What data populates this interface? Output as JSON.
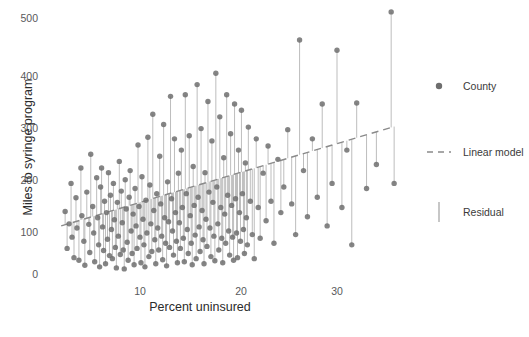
{
  "chart_data": {
    "type": "scatter",
    "title": "",
    "xlabel": "Percent uninsured",
    "ylabel": "Miles to syringe program",
    "xlim": [
      1.5,
      37.5
    ],
    "ylim": [
      -18,
      520
    ],
    "xticks": [
      10,
      20,
      30
    ],
    "yticks": [
      0,
      100,
      200,
      300,
      400,
      500
    ],
    "grid": false,
    "legend_position": "right",
    "point_color": "#6e6e6e",
    "line_color": "#8a8a8a",
    "residual_color": "#b5b5b5",
    "legend": [
      {
        "label": "County",
        "marker": "circle"
      },
      {
        "label": "Linear model",
        "marker": "dashed-line"
      },
      {
        "label": "Residual",
        "marker": "vertical-line"
      }
    ],
    "linear_model": {
      "x_start": 2.0,
      "y_start": 92.0,
      "x_end": 35.8,
      "y_end": 286.0,
      "slope": 5.74,
      "intercept": 80.5
    },
    "series": [
      {
        "name": "County",
        "points": [
          [
            2.4,
            120
          ],
          [
            2.6,
            48
          ],
          [
            2.8,
            96
          ],
          [
            3.0,
            175
          ],
          [
            3.1,
            70
          ],
          [
            3.3,
            30
          ],
          [
            3.5,
            147
          ],
          [
            3.6,
            88
          ],
          [
            3.8,
            25
          ],
          [
            4.0,
            205
          ],
          [
            4.1,
            112
          ],
          [
            4.3,
            62
          ],
          [
            4.4,
            15
          ],
          [
            4.6,
            158
          ],
          [
            4.8,
            95
          ],
          [
            4.9,
            40
          ],
          [
            5.0,
            232
          ],
          [
            5.2,
            130
          ],
          [
            5.3,
            78
          ],
          [
            5.4,
            22
          ],
          [
            5.6,
            186
          ],
          [
            5.7,
            108
          ],
          [
            5.8,
            55
          ],
          [
            5.9,
            12
          ],
          [
            6.0,
            168
          ],
          [
            6.1,
            205
          ],
          [
            6.2,
            90
          ],
          [
            6.3,
            44
          ],
          [
            6.4,
            140
          ],
          [
            6.5,
            18
          ],
          [
            6.6,
            118
          ],
          [
            6.7,
            66
          ],
          [
            6.8,
            196
          ],
          [
            6.9,
            34
          ],
          [
            7.0,
            152
          ],
          [
            7.1,
            85
          ],
          [
            7.2,
            28
          ],
          [
            7.3,
            175
          ],
          [
            7.4,
            104
          ],
          [
            7.5,
            50
          ],
          [
            7.6,
            10
          ],
          [
            7.7,
            138
          ],
          [
            7.8,
            72
          ],
          [
            7.9,
            218
          ],
          [
            8.0,
            36
          ],
          [
            8.1,
            160
          ],
          [
            8.2,
            98
          ],
          [
            8.3,
            45
          ],
          [
            8.4,
            8
          ],
          [
            8.5,
            182
          ],
          [
            8.6,
            125
          ],
          [
            8.7,
            60
          ],
          [
            8.8,
            25
          ],
          [
            8.9,
            148
          ],
          [
            9.0,
            200
          ],
          [
            9.1,
            82
          ],
          [
            9.2,
            38
          ],
          [
            9.3,
            115
          ],
          [
            9.4,
            16
          ],
          [
            9.5,
            165
          ],
          [
            9.6,
            92
          ],
          [
            9.7,
            48
          ],
          [
            9.8,
            250
          ],
          [
            9.9,
            130
          ],
          [
            10.0,
            70
          ],
          [
            10.1,
            20
          ],
          [
            10.2,
            188
          ],
          [
            10.3,
            105
          ],
          [
            10.4,
            55
          ],
          [
            10.5,
            12
          ],
          [
            10.6,
            142
          ],
          [
            10.7,
            78
          ],
          [
            10.8,
            265
          ],
          [
            10.9,
            32
          ],
          [
            11.0,
            172
          ],
          [
            11.1,
            96
          ],
          [
            11.2,
            42
          ],
          [
            11.3,
            310
          ],
          [
            11.4,
            122
          ],
          [
            11.5,
            65
          ],
          [
            11.6,
            18
          ],
          [
            11.7,
            155
          ],
          [
            11.8,
            88
          ],
          [
            11.9,
            45
          ],
          [
            12.0,
            228
          ],
          [
            12.1,
            135
          ],
          [
            12.2,
            72
          ],
          [
            12.3,
            26
          ],
          [
            12.4,
            290
          ],
          [
            12.5,
            108
          ],
          [
            12.6,
            58
          ],
          [
            12.7,
            14
          ],
          [
            12.8,
            178
          ],
          [
            12.9,
            100
          ],
          [
            13.0,
            50
          ],
          [
            13.1,
            345
          ],
          [
            13.2,
            145
          ],
          [
            13.3,
            82
          ],
          [
            13.4,
            35
          ],
          [
            13.5,
            262
          ],
          [
            13.6,
            118
          ],
          [
            13.7,
            62
          ],
          [
            13.8,
            20
          ],
          [
            13.9,
            195
          ],
          [
            14.0,
            98
          ],
          [
            14.1,
            48
          ],
          [
            14.2,
            240
          ],
          [
            14.3,
            128
          ],
          [
            14.4,
            68
          ],
          [
            14.5,
            22
          ],
          [
            14.6,
            348
          ],
          [
            14.7,
            155
          ],
          [
            14.8,
            85
          ],
          [
            14.9,
            38
          ],
          [
            15.0,
            268
          ],
          [
            15.1,
            112
          ],
          [
            15.2,
            58
          ],
          [
            15.3,
            16
          ],
          [
            15.4,
            208
          ],
          [
            15.5,
            132
          ],
          [
            15.6,
            74
          ],
          [
            15.7,
            28
          ],
          [
            15.8,
            368
          ],
          [
            15.9,
            148
          ],
          [
            16.0,
            90
          ],
          [
            16.1,
            42
          ],
          [
            16.2,
            282
          ],
          [
            16.3,
            122
          ],
          [
            16.4,
            65
          ],
          [
            16.5,
            18
          ],
          [
            16.6,
            196
          ],
          [
            16.7,
            105
          ],
          [
            16.8,
            52
          ],
          [
            16.9,
            335
          ],
          [
            17.0,
            158
          ],
          [
            17.1,
            88
          ],
          [
            17.2,
            32
          ],
          [
            17.3,
            258
          ],
          [
            17.4,
            138
          ],
          [
            17.5,
            72
          ],
          [
            17.6,
            24
          ],
          [
            17.7,
            390
          ],
          [
            17.8,
            168
          ],
          [
            17.9,
            96
          ],
          [
            18.0,
            45
          ],
          [
            18.1,
            305
          ],
          [
            18.2,
            128
          ],
          [
            18.3,
            68
          ],
          [
            18.4,
            20
          ],
          [
            18.5,
            225
          ],
          [
            18.6,
            115
          ],
          [
            18.7,
            58
          ],
          [
            18.8,
            348
          ],
          [
            18.9,
            152
          ],
          [
            19.0,
            82
          ],
          [
            19.1,
            35
          ],
          [
            19.2,
            272
          ],
          [
            19.3,
            132
          ],
          [
            19.4,
            70
          ],
          [
            19.5,
            25
          ],
          [
            19.6,
            330
          ],
          [
            19.7,
            145
          ],
          [
            19.8,
            78
          ],
          [
            19.9,
            30
          ],
          [
            20.0,
            240
          ],
          [
            20.1,
            118
          ],
          [
            20.2,
            62
          ],
          [
            20.3,
            318
          ],
          [
            20.4,
            155
          ],
          [
            20.5,
            85
          ],
          [
            20.6,
            38
          ],
          [
            20.7,
            215
          ],
          [
            20.8,
            108
          ],
          [
            20.9,
            55
          ],
          [
            21.0,
            285
          ],
          [
            21.2,
            140
          ],
          [
            21.4,
            75
          ],
          [
            21.6,
            28
          ],
          [
            21.8,
            262
          ],
          [
            22.0,
            128
          ],
          [
            22.2,
            68
          ],
          [
            22.5,
            195
          ],
          [
            22.8,
            102
          ],
          [
            23.0,
            248
          ],
          [
            23.3,
            140
          ],
          [
            23.6,
            58
          ],
          [
            24.0,
            222
          ],
          [
            24.3,
            118
          ],
          [
            24.6,
            168
          ],
          [
            25.0,
            280
          ],
          [
            25.4,
            135
          ],
          [
            25.8,
            75
          ],
          [
            26.2,
            455
          ],
          [
            26.6,
            200
          ],
          [
            27.0,
            110
          ],
          [
            27.5,
            262
          ],
          [
            28.0,
            148
          ],
          [
            28.5,
            330
          ],
          [
            29.0,
            92
          ],
          [
            29.5,
            175
          ],
          [
            30.0,
            435
          ],
          [
            30.5,
            128
          ],
          [
            31.0,
            240
          ],
          [
            31.5,
            55
          ],
          [
            32.0,
            332
          ],
          [
            33.0,
            165
          ],
          [
            34.0,
            212
          ],
          [
            35.5,
            510
          ],
          [
            35.8,
            175
          ]
        ]
      }
    ]
  }
}
